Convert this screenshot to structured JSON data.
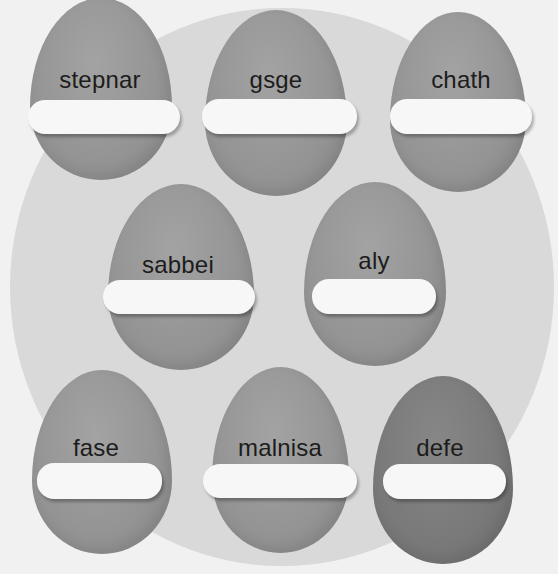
{
  "worksheet": {
    "background_color": "#f1f1f1",
    "circle_color": "#d9d9d9",
    "egg_color": "#959595",
    "egg_dark_color": "#7a7a7a",
    "eggs": [
      {
        "word": "stepnar",
        "answer": "",
        "placeholder": ""
      },
      {
        "word": "gsge",
        "answer": "",
        "placeholder": ""
      },
      {
        "word": "chath",
        "answer": "",
        "placeholder": ""
      },
      {
        "word": "sabbei",
        "answer": "",
        "placeholder": ""
      },
      {
        "word": "aly",
        "answer": "",
        "placeholder": ""
      },
      {
        "word": "fase",
        "answer": "",
        "placeholder": ""
      },
      {
        "word": "malnisa",
        "answer": "",
        "placeholder": ""
      },
      {
        "word": "defe",
        "answer": "",
        "placeholder": ""
      }
    ]
  }
}
